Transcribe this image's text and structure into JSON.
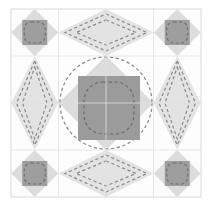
{
  "figure": {
    "title": "Quilt Block Pattern",
    "caption": "",
    "width": 213,
    "height": 208
  },
  "canvas": {
    "background": "#ffffff",
    "block": {
      "x": 11,
      "y": 9,
      "width": 190,
      "height": 188
    }
  },
  "palette": {
    "background": "#ffffff",
    "block_fill": "#fdfdfd",
    "light_patch": "#e3e3e3",
    "mid_patch": "#dcdcdc",
    "dark_patch": "#9b9b9b",
    "corner_square": "#9e9e9e",
    "grid_line": "#e0e0e0",
    "outline": "#d6d6d6",
    "quilting_line": "#8a8a8a",
    "border_line": "#d9d9d9"
  },
  "geometry": {
    "grid": {
      "columns": 4,
      "rows": 4,
      "cell_width": 47.5,
      "cell_height": 47.0,
      "x_lines": [
        11,
        58.5,
        106,
        153.5,
        201
      ],
      "y_lines": [
        9,
        56,
        103,
        150,
        197
      ],
      "stroke_width": 0.8
    },
    "center_square": {
      "x": 78,
      "y": 76,
      "width": 62,
      "height": 64
    },
    "center_diamond": {
      "cx": 106,
      "cy": 103,
      "rx": 47.5,
      "ry": 47
    },
    "big_circle": {
      "cx": 106,
      "cy": 103,
      "r": 46
    },
    "corner_units": [
      {
        "name": "corner-top-left",
        "cx": 34.75,
        "cy": 32.5
      },
      {
        "name": "corner-top-right",
        "cx": 177.25,
        "cy": 32.5
      },
      {
        "name": "corner-bottom-left",
        "cx": 34.75,
        "cy": 173.5
      },
      {
        "name": "corner-bottom-right",
        "cx": 177.25,
        "cy": 173.5
      }
    ],
    "corner_diamond_radius": {
      "rx": 23.5,
      "ry": 23.5
    },
    "corner_inner_square": {
      "size": 25
    },
    "edge_units": [
      {
        "name": "edge-top",
        "cx": 106,
        "cy": 32.5,
        "rx": 47.5,
        "ry": 23.5,
        "orientation": "horizontal"
      },
      {
        "name": "edge-bottom",
        "cx": 106,
        "cy": 173.5,
        "rx": 47.5,
        "ry": 23.5,
        "orientation": "horizontal"
      },
      {
        "name": "edge-left",
        "cx": 34.75,
        "cy": 103,
        "rx": 23.5,
        "ry": 47,
        "orientation": "vertical"
      },
      {
        "name": "edge-right",
        "cx": 177.25,
        "cy": 103,
        "rx": 23.5,
        "ry": 47,
        "orientation": "vertical"
      }
    ]
  },
  "quilting": {
    "dash_pattern": "3.2 2.6",
    "stroke_width": 1.25,
    "color": "#8a8a8a",
    "center_rounded_square": {
      "x": 84,
      "y": 82,
      "width": 50,
      "height": 52,
      "radius": 19
    },
    "corner_rounded_square": {
      "size": 21,
      "radius": 7
    }
  },
  "labels": {
    "block_name": "",
    "notes": ""
  }
}
